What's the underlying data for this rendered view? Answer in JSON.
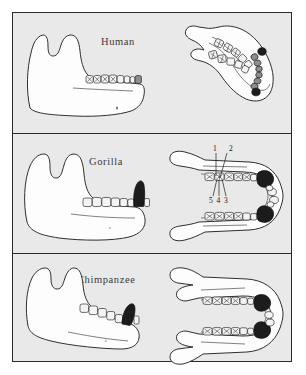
{
  "figure": {
    "background_color": "#ffffff",
    "panel_fill": "#e9e9e9",
    "border_color": "#2a2a2a",
    "tooth_fill": "#f4f4f4",
    "canine_color": "#1c1c1c",
    "molar_shade_color": "#8d8d8d"
  },
  "panels": [
    {
      "id": "human",
      "label": "Human",
      "views": [
        "lateral",
        "occlusal"
      ],
      "arch_shape": "parabolic",
      "canine_size": "small",
      "annotation": "c"
    },
    {
      "id": "gorilla",
      "label": "Gorilla",
      "views": [
        "lateral",
        "occlusal"
      ],
      "arch_shape": "u-shaped",
      "canine_size": "large",
      "annotation": "c",
      "cusp_labels": {
        "above": [
          "1",
          "2"
        ],
        "below": [
          "5",
          "4",
          "3"
        ]
      }
    },
    {
      "id": "chimpanzee",
      "label": "Chimpanzee",
      "views": [
        "lateral",
        "occlusal"
      ],
      "arch_shape": "u-shaped",
      "canine_size": "large",
      "annotation": "c"
    }
  ]
}
